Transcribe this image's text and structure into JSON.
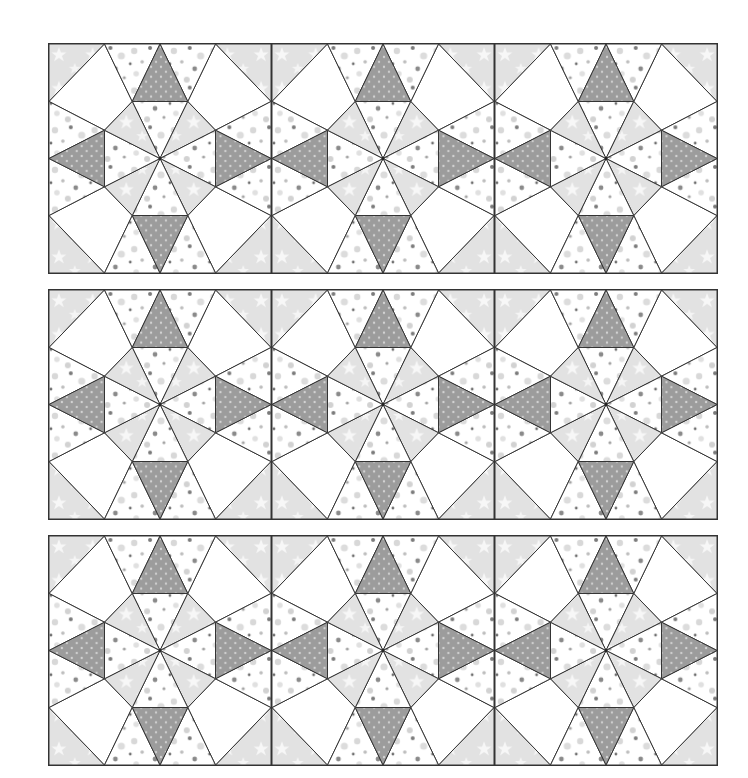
{
  "figure": {
    "rows": 3,
    "columns": 3,
    "panels": [
      {
        "id": "row-1",
        "top": 43
      },
      {
        "id": "row-2",
        "top": 289
      },
      {
        "id": "row-3",
        "top": 535
      }
    ],
    "colors": {
      "background": "#ffffff",
      "outline": "#333333",
      "dark_triangle": "#9c9c9c",
      "dark_triangle_dots": "#d4d4d4",
      "star_fabric": "#e2e2e2",
      "star_motif": "#f7f7f7",
      "dot_fabric_bg": "#ffffff",
      "dot_light": "#d8d8d8",
      "dot_dark": "#7a7a7a",
      "kite": "#ffffff"
    },
    "pieces": {
      "corner_triangles": "star fabric",
      "corner_kites": "plain white",
      "edge_triangles": "dot fabric",
      "point_triangles": "dark gray dotted",
      "octagon_center_orthogonal": "dot fabric",
      "octagon_center_diagonal": "star fabric"
    }
  }
}
